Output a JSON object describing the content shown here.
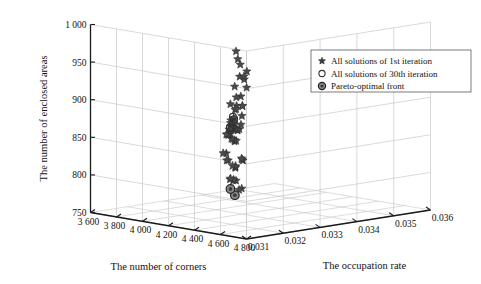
{
  "figure": {
    "kind": "3d-scatter-plot",
    "background": "#ffffff"
  },
  "legend": {
    "position": "top-right",
    "items": [
      {
        "marker": "star-icon",
        "label": "All solutions of 1st iteration"
      },
      {
        "marker": "open-circle-icon",
        "label": "All solutions of 30th iteration"
      },
      {
        "marker": "filled-circle-icon",
        "label": "Pareto-optimal front"
      }
    ]
  },
  "chart_data": {
    "type": "scatter",
    "projection": "3d",
    "title": "",
    "xlabel": "The number of corners",
    "ylabel": "The occupation rate",
    "zlabel": "The number of enclosed areas",
    "xticks": [
      "4 800",
      "4 600",
      "4 400",
      "4 200",
      "4 000",
      "3 800",
      "3 600"
    ],
    "xtick_values": [
      4800,
      4600,
      4400,
      4200,
      4000,
      3800,
      3600
    ],
    "yticks": [
      "0.031",
      "0.032",
      "0.033",
      "0.034",
      "0.035",
      "0.036"
    ],
    "ytick_values": [
      0.031,
      0.032,
      0.033,
      0.034,
      0.035,
      0.036
    ],
    "zticks": [
      "750",
      "800",
      "850",
      "900",
      "950",
      "1 000"
    ],
    "ztick_values": [
      750,
      800,
      850,
      900,
      950,
      1000
    ],
    "xlim": [
      3600,
      4800
    ],
    "ylim": [
      0.031,
      0.036
    ],
    "zlim": [
      750,
      1000
    ],
    "xdir": "reversed",
    "grid": true,
    "series": [
      {
        "name": "All solutions of 1st iteration",
        "marker": "star",
        "points": [
          [
            4380,
            0.0322,
            978
          ],
          [
            4010,
            0.0338,
            928
          ],
          [
            3905,
            0.0341,
            912
          ],
          [
            3860,
            0.034,
            902
          ],
          [
            3742,
            0.0345,
            931
          ],
          [
            3700,
            0.0347,
            905
          ],
          [
            3648,
            0.0349,
            918
          ],
          [
            3620,
            0.0351,
            900
          ],
          [
            3612,
            0.0352,
            884
          ],
          [
            4118,
            0.0333,
            889
          ],
          [
            4060,
            0.0335,
            886
          ],
          [
            3992,
            0.0337,
            895
          ],
          [
            3940,
            0.0336,
            884
          ],
          [
            3872,
            0.034,
            888
          ],
          [
            3790,
            0.0343,
            872
          ],
          [
            4248,
            0.0328,
            872
          ],
          [
            4170,
            0.0331,
            879
          ],
          [
            3966,
            0.0336,
            866
          ],
          [
            3916,
            0.0337,
            861
          ],
          [
            3806,
            0.0342,
            868
          ],
          [
            3758,
            0.0344,
            866
          ],
          [
            4108,
            0.0332,
            857
          ],
          [
            4066,
            0.0334,
            856
          ],
          [
            4024,
            0.0335,
            853
          ],
          [
            3984,
            0.0336,
            852
          ],
          [
            3950,
            0.0337,
            850
          ],
          [
            3906,
            0.0338,
            856
          ],
          [
            3872,
            0.0339,
            852
          ],
          [
            3836,
            0.034,
            849
          ],
          [
            3800,
            0.0341,
            851
          ],
          [
            4142,
            0.033,
            845
          ],
          [
            4098,
            0.0332,
            843
          ],
          [
            4056,
            0.0333,
            842
          ],
          [
            4014,
            0.0334,
            841
          ],
          [
            3976,
            0.0335,
            840
          ],
          [
            3930,
            0.0336,
            843
          ],
          [
            3896,
            0.0337,
            841
          ],
          [
            3860,
            0.0338,
            840
          ],
          [
            3824,
            0.0339,
            838
          ],
          [
            3788,
            0.0341,
            842
          ],
          [
            3746,
            0.0343,
            838
          ],
          [
            4320,
            0.0326,
            828
          ],
          [
            4256,
            0.0328,
            826
          ],
          [
            4196,
            0.033,
            824
          ],
          [
            4290,
            0.0325,
            818
          ],
          [
            4232,
            0.0327,
            816
          ],
          [
            4178,
            0.0329,
            814
          ],
          [
            4126,
            0.033,
            812
          ],
          [
            4380,
            0.0322,
            806
          ],
          [
            4330,
            0.0323,
            804
          ],
          [
            4276,
            0.0325,
            802
          ],
          [
            4220,
            0.0326,
            800
          ],
          [
            4168,
            0.0328,
            798
          ],
          [
            4480,
            0.032,
            800
          ],
          [
            4432,
            0.0321,
            796
          ],
          [
            3980,
            0.0334,
            812
          ],
          [
            3940,
            0.0335,
            810
          ],
          [
            3880,
            0.0337,
            816
          ],
          [
            3828,
            0.0338,
            814
          ]
        ]
      },
      {
        "name": "All solutions of 30th iteration",
        "marker": "open-circle",
        "points": [
          [
            3790,
            0.0342,
            858
          ],
          [
            3742,
            0.0344,
            852
          ],
          [
            3842,
            0.034,
            846
          ],
          [
            3796,
            0.0341,
            844
          ],
          [
            3880,
            0.0338,
            850
          ],
          [
            3712,
            0.0345,
            846
          ]
        ]
      },
      {
        "name": "Pareto-optimal front",
        "marker": "filled-circle",
        "points": [
          [
            4116,
            0.0331,
            772
          ],
          [
            3884,
            0.0338,
            768
          ]
        ]
      }
    ]
  }
}
